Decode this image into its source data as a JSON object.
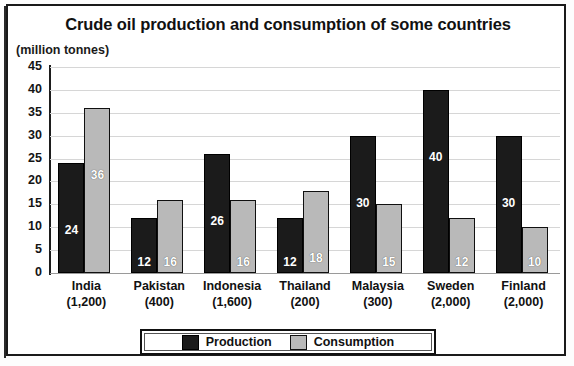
{
  "chart_data": {
    "type": "bar",
    "title": "Crude oil production and consumption of some countries",
    "unit_label": "(million tonnes)",
    "xlabel": "",
    "ylabel": "",
    "ylim": [
      0,
      45
    ],
    "ytick_step": 5,
    "yticks": [
      "45",
      "40",
      "35",
      "30",
      "25",
      "20",
      "15",
      "10",
      "5",
      "0"
    ],
    "grid": true,
    "legend_position": "bottom-center",
    "categories": [
      "India",
      "Pakistan",
      "Indonesia",
      "Thailand",
      "Malaysia",
      "Sweden",
      "Finland"
    ],
    "category_sublabels": [
      "(1,200)",
      "(400)",
      "(1,600)",
      "(200)",
      "(300)",
      "(2,000)",
      "(2,000)"
    ],
    "series": [
      {
        "name": "Production",
        "color": "#1b1b1b",
        "values": [
          24,
          12,
          26,
          12,
          30,
          40,
          30
        ],
        "labels": [
          "24",
          "12",
          "26",
          "12",
          "30",
          "40",
          "30"
        ]
      },
      {
        "name": "Consumption",
        "color": "#b9b9b9",
        "values": [
          36,
          16,
          16,
          18,
          15,
          12,
          10
        ],
        "labels": [
          "36",
          "16",
          "16",
          "18",
          "15",
          "12",
          "10"
        ]
      }
    ]
  },
  "legend": {
    "production_label": "Production",
    "consumption_label": "Consumption"
  }
}
